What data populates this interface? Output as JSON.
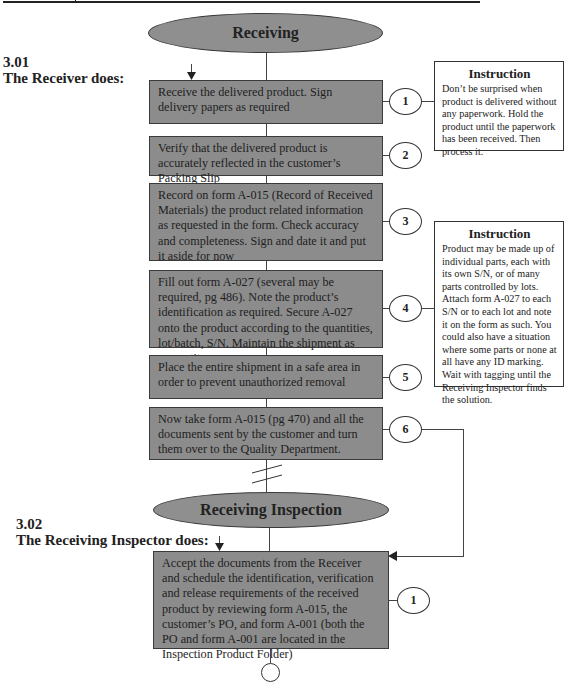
{
  "header_rule": {
    "divider": true
  },
  "sections": [
    {
      "number": "3.01",
      "title": "The Receiver does:",
      "start_label": "Receiving",
      "steps": [
        {
          "n": "1",
          "text": "Receive the delivered product. Sign delivery papers as required"
        },
        {
          "n": "2",
          "text": "Verify that the delivered product is accurately reflected in the customer’s Packing Slip"
        },
        {
          "n": "3",
          "text": "Record on form A-015 (Record of Received Materials) the product related information as requested in the form. Check accuracy and completeness. Sign and date it and put it aside for now"
        },
        {
          "n": "4",
          "text": "Fill out form A-027 (several may be required, pg 486). Note the product’s identification as required. Secure A-027 onto the product according to the quantities, lot/batch, S/N. Maintain the shipment as one entity"
        },
        {
          "n": "5",
          "text": "Place the entire shipment in a safe area in order to prevent unauthorized removal"
        },
        {
          "n": "6",
          "text": "Now take form A-015 (pg 470) and all the documents sent by the customer and turn them over to the Quality Department."
        }
      ],
      "instructions": [
        {
          "title": "Instruction",
          "text": "Don’t be surprised when product is delivered without any paperwork. Hold the product until the paperwork has been received. Then process it."
        },
        {
          "title": "Instruction",
          "text": "Product may be made up of individual parts, each with its own S/N, or of many parts controlled by lots. Attach form A-027 to each S/N or to each lot and note it on the form as such. You could also have a situation where some parts or none at all have any ID marking. Wait with tagging until the Receiving Inspector finds the solution."
        }
      ]
    },
    {
      "number": "3.02",
      "title": "The Receiving Inspector does:",
      "start_label": "Receiving Inspection",
      "steps": [
        {
          "n": "1",
          "text": "Accept the documents from the Receiver and schedule the identification, verification and release requirements of the received product by reviewing form A-015, the customer’s PO, and form A-001 (both the PO and form A-001 are located in the Inspection Product Folder)"
        }
      ]
    }
  ],
  "colors": {
    "box_fill": "#8c8c8c",
    "oval_fill": "#8f8f8f",
    "line": "#444444",
    "background": "#ffffff"
  }
}
